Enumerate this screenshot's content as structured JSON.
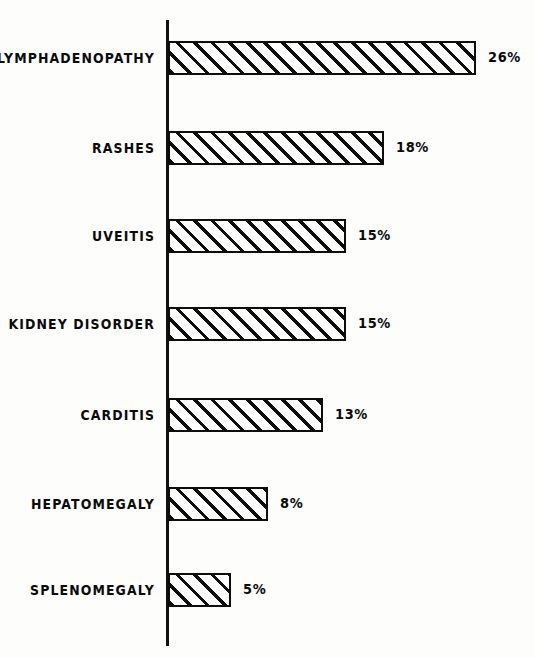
{
  "chart_data": {
    "type": "bar",
    "orientation": "horizontal",
    "title": "",
    "subtitle": "",
    "xlabel": "",
    "ylabel": "",
    "xlim": [
      0,
      28
    ],
    "grid": false,
    "legend": null,
    "axis": {
      "y_axis_visible": true,
      "x_axis_visible": false,
      "tick_labels": []
    },
    "style": {
      "bar_fill": "hatched-diagonal",
      "bar_border_color": "#0d0d0d",
      "background_color": "#ffffff",
      "text_color": "#0a0a0a"
    },
    "categories": [
      "LYMPHADENOPATHY",
      "RASHES",
      "UVEITIS",
      "KIDNEY DISORDER",
      "CARDITIS",
      "HEPATOMEGALY",
      "SPLENOMEGALY"
    ],
    "values": [
      26,
      18,
      15,
      15,
      13,
      8,
      5
    ],
    "value_labels": [
      "26%",
      "18%",
      "15%",
      "15%",
      "13%",
      "8%",
      "5%"
    ],
    "bars": [
      {
        "category": "LYMPHADENOPATHY",
        "value": 26,
        "label": "26%"
      },
      {
        "category": "RASHES",
        "value": 18,
        "label": "18%"
      },
      {
        "category": "UVEITIS",
        "value": 15,
        "label": "15%"
      },
      {
        "category": "KIDNEY DISORDER",
        "value": 15,
        "label": "15%"
      },
      {
        "category": "CARDITIS",
        "value": 13,
        "label": "13%"
      },
      {
        "category": "HEPATOMEGALY",
        "value": 8,
        "label": "8%"
      },
      {
        "category": "SPLENOMEGALY",
        "value": 5,
        "label": "5%"
      }
    ]
  },
  "layout": {
    "row_tops": [
      41,
      131,
      219,
      307,
      398,
      487,
      573
    ],
    "bar_widths": [
      308,
      216,
      178,
      178,
      155,
      100,
      63
    ]
  }
}
